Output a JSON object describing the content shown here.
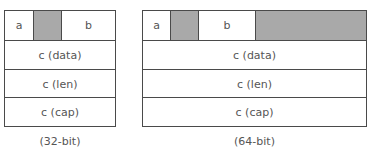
{
  "diagrams": [
    {
      "id": "32",
      "caption": "(32-bit)",
      "first_row": [
        {
          "label": "a",
          "type": "field"
        },
        {
          "label": "",
          "type": "padding"
        },
        {
          "label": "b",
          "type": "field"
        }
      ],
      "rows": [
        "c (data)",
        "c (len)",
        "c (cap)"
      ]
    },
    {
      "id": "64",
      "caption": "(64-bit)",
      "first_row": [
        {
          "label": "a",
          "type": "field"
        },
        {
          "label": "",
          "type": "padding"
        },
        {
          "label": "b",
          "type": "field"
        },
        {
          "label": "",
          "type": "padding"
        }
      ],
      "rows": [
        "c (data)",
        "c (len)",
        "c (cap)"
      ]
    }
  ],
  "colors": {
    "border": "#4a4a4a",
    "padding": "#a9a9a9",
    "text": "#555555"
  }
}
